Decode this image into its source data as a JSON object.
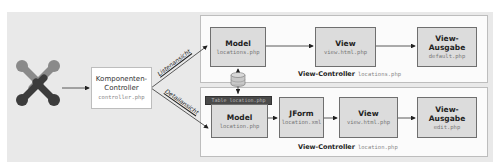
{
  "diagram": {
    "logo": {
      "name": "joomla-logo",
      "colors": [
        "#8a8a8a",
        "#3c3c3c"
      ]
    },
    "component_controller": {
      "title_line1": "Komponenten-",
      "title_line2": "Controller",
      "file": "controller.php"
    },
    "edges": {
      "list_view": "Listenansicht",
      "detail_view": "Detailansicht"
    },
    "list_view_controller": {
      "label": "View-Controller",
      "file": "locations.php",
      "boxes": [
        {
          "title": "Model",
          "file": "locations.php"
        },
        {
          "title": "View",
          "file": "view.html.php"
        },
        {
          "title": "View-Ausgabe",
          "file": "default.php"
        }
      ]
    },
    "database": {
      "name": "database-cylinder"
    },
    "table_bar": {
      "label": "Table location.php"
    },
    "detail_view_controller": {
      "label": "View-Controller",
      "file": "location.php",
      "boxes": [
        {
          "title": "Model",
          "file": "location.php"
        },
        {
          "title": "JForm",
          "file": "location.xml"
        },
        {
          "title": "View",
          "file": "view.html.php"
        },
        {
          "title": "View-Ausgabe",
          "file": "edit.php"
        }
      ]
    },
    "colors": {
      "background": "#e9e9e9",
      "box_fill": "#dcdcdc",
      "box_border": "#6f6f6f",
      "table_bar": "#4a4a4a"
    }
  }
}
